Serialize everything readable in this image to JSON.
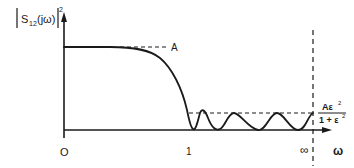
{
  "figure": {
    "y_axis_label": "|S12(jω)|²",
    "y_label_parts": {
      "s": "S",
      "sub": "12",
      "arg": "(jω)",
      "sup": "2"
    },
    "x_axis_label": "ω",
    "x_ticks": {
      "origin": "O",
      "one": "1",
      "infinity": "∞"
    },
    "level_A": "A",
    "ripple_level": {
      "numerator": "Aε²",
      "numerator_base": "Aε",
      "numerator_sup": "2",
      "denominator": "1 + ε²",
      "denominator_base": "1 + ε",
      "denominator_sup": "2"
    }
  },
  "colors": {
    "ink": "#1a1a1a",
    "background": "#ffffff"
  }
}
